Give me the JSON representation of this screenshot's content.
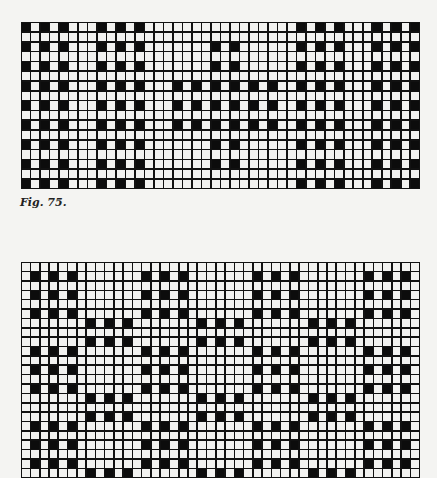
{
  "figure_label": "Fig. 75.",
  "colors": {
    "ink": "#0c0c0c",
    "paper": "#f2f2f0",
    "line": "#111111"
  },
  "grids": [
    {
      "name": "top-weave-pattern",
      "left": 21,
      "top": 22,
      "cols": 42,
      "rows": 17,
      "cell_w": 9.45,
      "cell_h": 9.7,
      "stripe_groups": [
        {
          "cols": [
            0,
            2,
            4
          ],
          "rows": [
            0,
            2,
            4,
            6,
            8,
            10,
            12,
            14,
            16
          ]
        },
        {
          "cols": [
            8,
            10,
            12
          ],
          "rows": [
            0,
            2,
            4,
            6,
            8,
            10,
            12,
            14,
            16
          ]
        },
        {
          "cols": [
            29,
            31,
            33
          ],
          "rows": [
            0,
            2,
            4,
            6,
            8,
            10,
            12,
            14,
            16
          ]
        },
        {
          "cols": [
            37,
            39,
            41
          ],
          "rows": [
            0,
            2,
            4,
            6,
            8,
            10,
            12,
            14,
            16
          ]
        },
        {
          "cols": [
            20,
            22
          ],
          "rows": [
            2,
            4,
            12,
            14
          ]
        },
        {
          "cols": [
            16,
            18,
            20,
            22,
            24,
            26
          ],
          "rows": [
            6,
            8,
            10
          ]
        }
      ]
    },
    {
      "name": "bottom-weave-pattern",
      "left": 21,
      "top": 262,
      "cols": 43,
      "rows": 23,
      "cell_w": 9.23,
      "cell_h": 9.3,
      "stripe_groups": [
        {
          "cols": [
            1,
            3,
            5,
            13,
            15,
            17,
            25,
            27,
            29,
            37,
            39,
            41
          ],
          "rows": [
            1,
            3,
            5,
            9,
            11,
            13,
            17,
            19,
            21
          ]
        },
        {
          "cols": [
            7,
            9,
            11,
            19,
            21,
            23,
            31,
            33,
            35
          ],
          "rows": [
            6,
            8,
            14,
            16,
            22
          ]
        }
      ]
    }
  ]
}
